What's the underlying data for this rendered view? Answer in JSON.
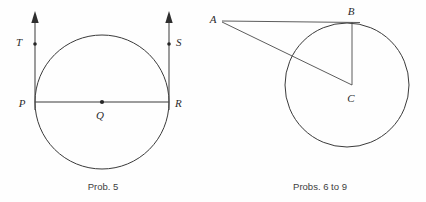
{
  "page": {
    "background_color": "#fefefe",
    "ink_color": "#3a3a3a",
    "width": 426,
    "height": 202
  },
  "figures": [
    {
      "id": "prob-5",
      "caption": "Prob. 5",
      "caption_x": 103,
      "caption_y": 190,
      "circle": {
        "cx": 102,
        "cy": 102,
        "r": 67
      },
      "center_point": {
        "label": "Q",
        "x": 102,
        "y": 102,
        "label_x": 97,
        "label_y": 114
      },
      "chord": {
        "from": "P",
        "to": "R",
        "x1": 35,
        "y1": 102,
        "x2": 169,
        "y2": 102
      },
      "tangent_lines": [
        {
          "name": "tangent-left",
          "x": 35,
          "top_y": 16,
          "bottom_y": 110
        },
        {
          "name": "tangent-right",
          "x": 169,
          "top_y": 16,
          "bottom_y": 110
        }
      ],
      "points": [
        {
          "label": "P",
          "x": 35,
          "y": 102,
          "label_x": 22,
          "label_y": 104
        },
        {
          "label": "R",
          "x": 169,
          "y": 102,
          "label_x": 175,
          "label_y": 104
        },
        {
          "label": "T",
          "x": 35,
          "y": 44,
          "label_x": 19,
          "label_y": 43
        },
        {
          "label": "S",
          "x": 169,
          "y": 44,
          "label_x": 176,
          "label_y": 43
        }
      ]
    },
    {
      "id": "probs-6-to-9",
      "caption": "Probs. 6 to 9",
      "caption_x": 320,
      "caption_y": 190,
      "circle": {
        "cx": 347,
        "cy": 85,
        "r": 62
      },
      "points": [
        {
          "label": "A",
          "x": 222,
          "y": 21,
          "label_x": 212,
          "label_y": 20
        },
        {
          "label": "B",
          "x": 352,
          "y": 23,
          "label_x": 350,
          "label_y": 11
        },
        {
          "label": "C",
          "x": 352,
          "y": 85,
          "label_x": 348,
          "label_y": 98
        }
      ],
      "segments": [
        {
          "name": "segment-ab",
          "from": "A",
          "to": "B",
          "x1": 222,
          "y1": 21,
          "x2": 358,
          "y2": 22
        },
        {
          "name": "segment-bc",
          "from": "B",
          "to": "C",
          "x1": 352,
          "y1": 22,
          "x2": 352,
          "y2": 85
        },
        {
          "name": "segment-ac",
          "from": "A",
          "to": "C",
          "x1": 222,
          "y1": 22,
          "x2": 352,
          "y2": 85
        }
      ]
    }
  ]
}
